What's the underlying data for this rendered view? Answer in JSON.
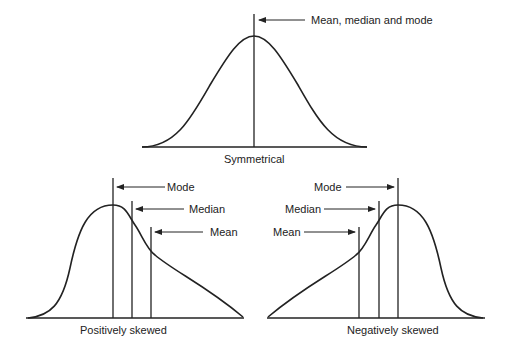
{
  "colors": {
    "line": "#222222",
    "background": "#ffffff"
  },
  "top": {
    "caption": "Symmetrical",
    "annotation": "Mean, median and mode"
  },
  "positive": {
    "caption": "Positively skewed",
    "mode": "Mode",
    "median": "Median",
    "mean": "Mean"
  },
  "negative": {
    "caption": "Negatively skewed",
    "mode": "Mode",
    "median": "Median",
    "mean": "Mean"
  }
}
